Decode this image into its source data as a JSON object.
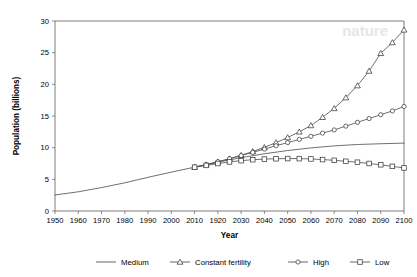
{
  "chart_data": {
    "type": "line",
    "title": "",
    "xlabel": "Year",
    "ylabel": "Population (billions)",
    "xlim": [
      1950,
      2100
    ],
    "ylim": [
      0,
      30
    ],
    "grid": false,
    "legend_position": "bottom",
    "xticks": [
      1950,
      1960,
      1970,
      1980,
      1990,
      2000,
      2010,
      1920,
      2030,
      2040,
      2050,
      2060,
      2070,
      2080,
      2090,
      2100
    ],
    "xtick_values": [
      1950,
      1960,
      1970,
      1980,
      1990,
      2000,
      2010,
      2020,
      2030,
      2040,
      2050,
      2060,
      2070,
      2080,
      2090,
      2100
    ],
    "yticks": [
      0,
      5,
      10,
      15,
      20,
      25,
      30
    ],
    "series": [
      {
        "name": "Medium",
        "marker": "none",
        "x": [
          1950,
          1960,
          1970,
          1980,
          1990,
          2000,
          2010,
          2020,
          2030,
          2040,
          2050,
          2060,
          2070,
          2080,
          2090,
          2100
        ],
        "values": [
          2.53,
          3.03,
          3.7,
          4.45,
          5.32,
          6.14,
          6.92,
          7.72,
          8.42,
          9.04,
          9.55,
          9.96,
          10.28,
          10.5,
          10.62,
          10.72
        ]
      },
      {
        "name": "Constant fertility",
        "marker": "triangle",
        "x": [
          2010,
          2015,
          2020,
          2025,
          2030,
          2035,
          2040,
          2045,
          2050,
          2055,
          2060,
          2065,
          2070,
          2075,
          2080,
          2085,
          2090,
          2095,
          2100
        ],
        "values": [
          6.92,
          7.3,
          7.75,
          8.25,
          8.8,
          9.4,
          10.05,
          10.8,
          11.6,
          12.5,
          13.5,
          14.8,
          16.2,
          17.9,
          19.8,
          22.1,
          24.9,
          26.6,
          28.6
        ]
      },
      {
        "name": "High",
        "marker": "circle",
        "x": [
          2010,
          2015,
          2020,
          2025,
          2030,
          2035,
          2040,
          2045,
          2050,
          2055,
          2060,
          2065,
          2070,
          2075,
          2080,
          2085,
          2090,
          2095,
          2100
        ],
        "values": [
          6.92,
          7.33,
          7.78,
          8.25,
          8.75,
          9.25,
          9.78,
          10.3,
          10.8,
          11.3,
          11.8,
          12.3,
          12.8,
          13.4,
          14.0,
          14.6,
          15.2,
          15.8,
          16.5
        ]
      },
      {
        "name": "Low",
        "marker": "square",
        "x": [
          2010,
          2015,
          2020,
          2025,
          2030,
          2035,
          2040,
          2045,
          2050,
          2055,
          2060,
          2065,
          2070,
          2075,
          2080,
          2085,
          2090,
          2095,
          2100
        ],
        "values": [
          6.92,
          7.2,
          7.5,
          7.75,
          7.95,
          8.1,
          8.2,
          8.25,
          8.28,
          8.27,
          8.22,
          8.12,
          8.0,
          7.85,
          7.7,
          7.5,
          7.3,
          7.05,
          6.8
        ]
      }
    ],
    "legend": [
      {
        "label": "Medium",
        "marker": "none"
      },
      {
        "label": "Constant fertility",
        "marker": "triangle"
      },
      {
        "label": "High",
        "marker": "circle"
      },
      {
        "label": "Low",
        "marker": "square"
      }
    ],
    "colors": {
      "line": "#555555",
      "marker_stroke": "#3c3c3c",
      "marker_fill": "#ffffff",
      "frame": "#6e6e6e",
      "text": "#000000"
    }
  }
}
